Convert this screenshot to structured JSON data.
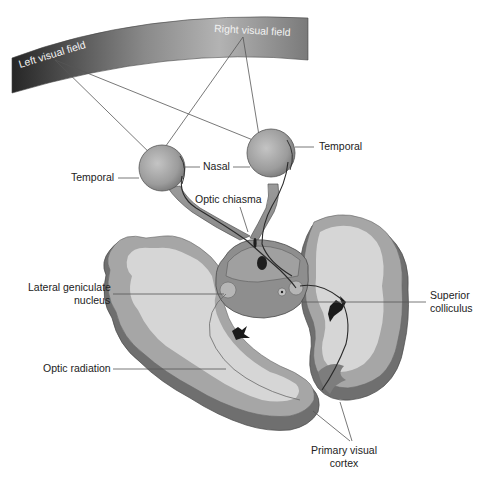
{
  "diagram": {
    "visual_field": {
      "left_label": "Left visual field",
      "right_label": "Right visual field"
    },
    "labels": {
      "temporal_left": "Temporal",
      "temporal_right": "Temporal",
      "nasal": "Nasal",
      "optic_chiasma": "Optic chiasma",
      "lgn_line1": "Lateral geniculate",
      "lgn_line2": "nucleus",
      "superior_line1": "Superior",
      "superior_line2": "colliculus",
      "optic_radiation": "Optic radiation",
      "cortex_line1": "Primary visual",
      "cortex_line2": "cortex"
    },
    "colors": {
      "field_dark": "#2b2b2b",
      "field_light": "#b5b5b5",
      "white_matter": "#d9d9d9",
      "grey_matter": "#a8a8a8",
      "edge": "#6e6e6e",
      "eye": "#9a9a9a",
      "line": "#555555"
    }
  }
}
